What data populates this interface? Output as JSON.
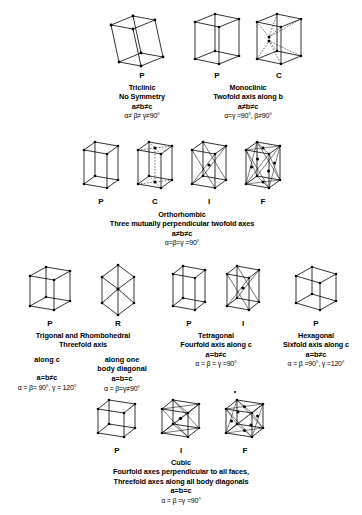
{
  "figure": {
    "sections": [
      {
        "id": "triclinic",
        "cells": [
          {
            "label": "P",
            "type": "triclinic-p"
          }
        ],
        "name": "Triclinic",
        "symmetry": "No Symmetry",
        "lattice": "a≠b≠c",
        "angles": "α≠ β≠ γ≠90°"
      },
      {
        "id": "monoclinic",
        "cells": [
          {
            "label": "P",
            "type": "monoclinic-p"
          },
          {
            "label": "C",
            "type": "monoclinic-c"
          }
        ],
        "name": "Monoclinic",
        "symmetry": "Twofold axis along b",
        "lattice": "a≠b≠c",
        "angles": "α=γ =90°, β≠90°"
      },
      {
        "id": "orthorhombic",
        "cells": [
          {
            "label": "P",
            "type": "ortho-p"
          },
          {
            "label": "C",
            "type": "ortho-c"
          },
          {
            "label": "I",
            "type": "ortho-i"
          },
          {
            "label": "F",
            "type": "ortho-f"
          }
        ],
        "name": "Orthorhombic",
        "symmetry": "Three mutually perpendicular twofold axes",
        "lattice": "a≠b≠c",
        "angles": "α=β=γ =90°"
      },
      {
        "id": "trigonal",
        "cells": [
          {
            "label": "P",
            "type": "trigonal-p"
          },
          {
            "label": "R",
            "type": "rhombohedral-r"
          }
        ],
        "name": "Trigonal and Rhombohedral",
        "symmetry": "Threefold axis",
        "columns": [
          {
            "heading": "along c",
            "lattice": "a=b≠c",
            "angles": "α = β= 90°,  γ = 120°"
          },
          {
            "heading_line1": "along one",
            "heading_line2": "body diagonal",
            "lattice": "a=b=c",
            "angles": "α = β=γ≠90°"
          }
        ]
      },
      {
        "id": "tetragonal",
        "cells": [
          {
            "label": "P",
            "type": "tetra-p"
          },
          {
            "label": "I",
            "type": "tetra-i"
          }
        ],
        "name": "Tetragonal",
        "symmetry": "Fourfold axis along c",
        "lattice": "a=b≠c",
        "angles": "α = β = γ =90°"
      },
      {
        "id": "hexagonal",
        "cells": [
          {
            "label": "P",
            "type": "hex-p"
          }
        ],
        "name": "Hexagonal",
        "symmetry": "Sixfold axis along c",
        "lattice": "a=b≠c",
        "angles": "α = β =90°, γ =120°"
      },
      {
        "id": "cubic",
        "cells": [
          {
            "label": "P",
            "type": "cubic-p"
          },
          {
            "label": "I",
            "type": "cubic-i"
          },
          {
            "label": "F",
            "type": "cubic-f"
          }
        ],
        "name": "Cubic",
        "symmetry_line1": "Fourfold axes perpendicular to all faces,",
        "symmetry_line2": "Threefold axes along all body diagonals",
        "lattice": "a=b=c",
        "angles": "α = β =γ =90°"
      }
    ]
  },
  "colors": {
    "ink": "#000000",
    "background": "#ffffff",
    "hidden_edge": "#9a9a9a"
  }
}
